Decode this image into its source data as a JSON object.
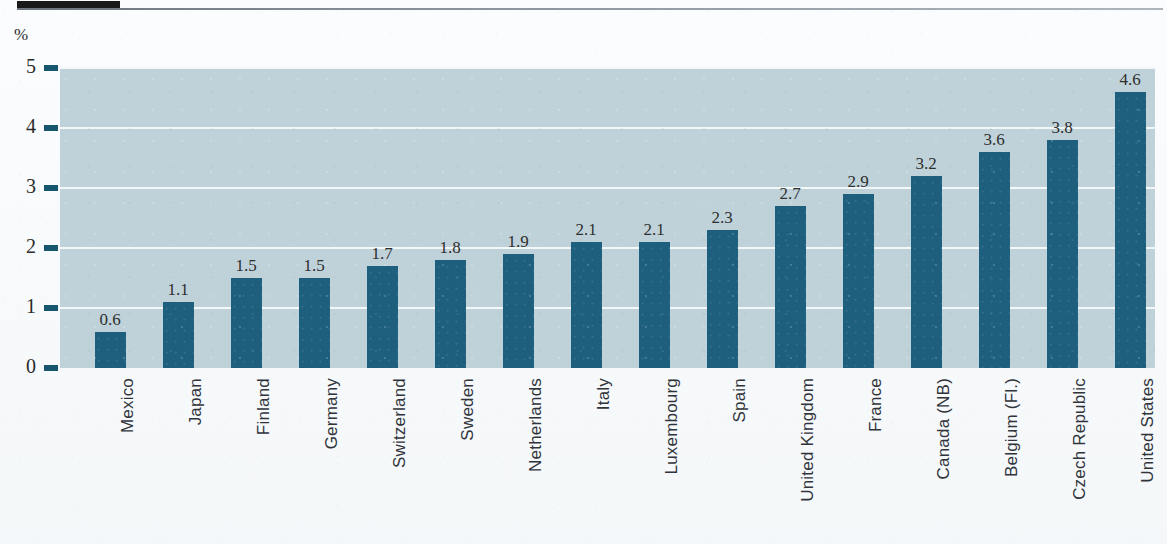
{
  "header": {
    "tab_marker": "",
    "rule": ""
  },
  "chart_data": {
    "type": "bar",
    "title": "",
    "subtitle": "",
    "xlabel": "",
    "ylabel": "%",
    "unit_label": "%",
    "ylim": [
      0,
      5
    ],
    "ytick_labels": [
      "5",
      "4",
      "3",
      "2",
      "1",
      "0"
    ],
    "ytick_values": [
      5,
      4,
      3,
      2,
      1,
      0
    ],
    "grid": true,
    "grid_orientation": "horizontal",
    "legend": null,
    "orientation": "vertical",
    "value_labels_shown": true,
    "categories": [
      "Mexico",
      "Japan",
      "Finland",
      "Germany",
      "Switzerland",
      "Sweden",
      "Netherlands",
      "Italy",
      "Luxembourg",
      "Spain",
      "United Kingdom",
      "France",
      "Canada (NB)",
      "Belgium (Fl.)",
      "Czech Republic",
      "United States"
    ],
    "values": [
      0.6,
      1.1,
      1.5,
      1.5,
      1.7,
      1.8,
      1.9,
      2.1,
      2.1,
      2.3,
      2.7,
      2.9,
      3.2,
      3.6,
      3.8,
      4.6
    ],
    "value_label_text": [
      "0.6",
      "1.1",
      "1.5",
      "1.5",
      "1.7",
      "1.8",
      "1.9",
      "2.1",
      "2.1",
      "2.3",
      "2.7",
      "2.9",
      "3.2",
      "3.6",
      "3.8",
      "4.6"
    ],
    "colors": {
      "bar": "#1d5f7c",
      "plot_background": "#bfd2d9",
      "gridline": "#f2f7f8",
      "tick_mark": "#17566f",
      "text": "#2b2b2b",
      "page_background": "#fbfcfd",
      "header_tab": "#1a1a1a"
    }
  }
}
